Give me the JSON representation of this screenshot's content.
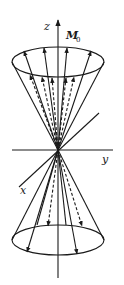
{
  "figure": {
    "labels": {
      "z_axis": "z",
      "y_axis": "y",
      "x_axis": "x",
      "magnetization": "M",
      "magnetization_subscript": "0"
    },
    "upper_cone": {
      "solid_arrows": 5,
      "dashed_arrows": 4,
      "direction": "up"
    },
    "lower_cone": {
      "solid_arrows": 2,
      "dashed_arrows": 2,
      "direction": "down"
    },
    "colors": {
      "ink": "#1a1a1a",
      "background": "#ffffff"
    }
  }
}
